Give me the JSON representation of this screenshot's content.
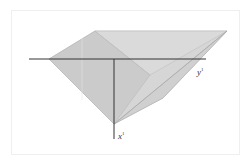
{
  "diagram": {
    "type": "3d-solid-projection",
    "labels": {
      "y_axis": "y",
      "y_axis_sup": "1",
      "x_axis": "x",
      "x_axis_sup": "1"
    },
    "colors": {
      "face_light": "#d9d9d9",
      "face_mid": "#cccccc",
      "face_dark": "#c2c2c2",
      "edge": "#b0b0b0",
      "axis": "#333333",
      "frame": "#efefef"
    }
  }
}
